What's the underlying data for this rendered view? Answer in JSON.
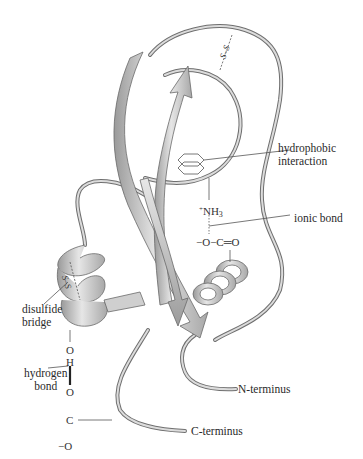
{
  "figure": {
    "labels": {
      "hydrophobic_line1": "hydrophobic",
      "hydrophobic_line2": "interaction",
      "ionic_bond": "ionic bond",
      "disulfide_line1": "disulfide",
      "disulfide_line2": "bridge",
      "hydrogen_line1": "hydrogen",
      "hydrogen_line2": "bond",
      "n_terminus": "N-terminus",
      "c_terminus": "C-terminus"
    },
    "chemistry": {
      "nh3_plus": "+",
      "nh3_n": "NH",
      "nh3_sub": "3",
      "carboxylate_top": "−O−C═O",
      "o_top": "O",
      "h": "H",
      "o_mid": "O",
      "c_low": "C",
      "o_low": "−O",
      "ss_top": "S–S",
      "ss_left": "S–S"
    },
    "colors": {
      "ribbon_fill": "#c9c9c9",
      "ribbon_dark": "#8f8f8f",
      "ribbon_edge": "#6a6a6a",
      "text": "#2a2a2a",
      "background": "#ffffff"
    }
  }
}
